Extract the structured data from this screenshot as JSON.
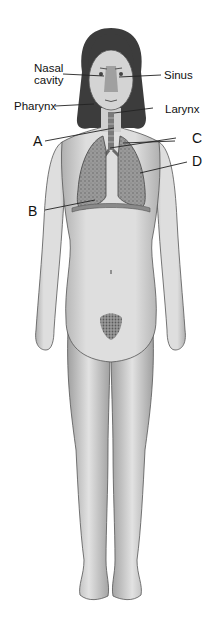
{
  "diagram": {
    "labels": {
      "nasal_cavity_line1": "Nasal",
      "nasal_cavity_line2": "cavity",
      "sinus": "Sinus",
      "pharynx": "Pharynx",
      "larynx": "Larynx",
      "a": "A",
      "b": "B",
      "c": "C",
      "d": "D"
    },
    "colors": {
      "background": "#ffffff",
      "skin": "#d9d9d9",
      "skin_shadow": "#a8a8a8",
      "hair": "#3a3a3a",
      "lung": "#8a8a8a",
      "outline": "#444444",
      "leader_line": "#222222"
    }
  }
}
